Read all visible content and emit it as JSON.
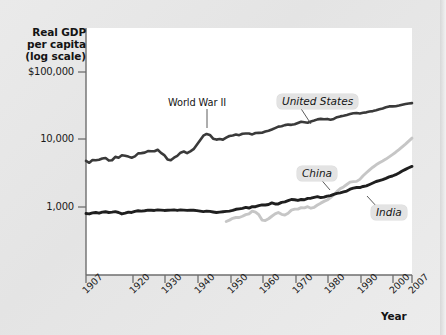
{
  "chart_data": {
    "type": "line",
    "title": "",
    "ylabel": "Real GDP per capita (log scale)",
    "xlabel": "Year",
    "ylabel_lines": [
      "Real GDP",
      "per capita",
      "(log scale)"
    ],
    "yscale": "log",
    "ytick_labels": [
      "$100,000",
      "10,000",
      "1,000"
    ],
    "ytick_values": [
      100000,
      10000,
      1000
    ],
    "ylim": [
      450,
      260000
    ],
    "xlim": [
      1907,
      2007
    ],
    "xtick_labels": [
      "1907",
      "1920",
      "1930",
      "1940",
      "1950",
      "1960",
      "1970",
      "1980",
      "1990",
      "2000",
      "2007"
    ],
    "xtick_values": [
      1907,
      1920,
      1930,
      1940,
      1950,
      1960,
      1970,
      1980,
      1990,
      2000,
      2007
    ],
    "grid": false,
    "legend_position": "inline-callouts",
    "annotations": [
      {
        "text": "World War II",
        "x": 1944,
        "y": 13000
      }
    ],
    "series": [
      {
        "name": "United States",
        "color": "#3a3a3a",
        "x": [
          1907,
          1908,
          1909,
          1910,
          1911,
          1912,
          1913,
          1914,
          1915,
          1916,
          1917,
          1918,
          1919,
          1920,
          1921,
          1922,
          1923,
          1924,
          1925,
          1926,
          1927,
          1928,
          1929,
          1930,
          1931,
          1932,
          1933,
          1934,
          1935,
          1936,
          1937,
          1938,
          1939,
          1940,
          1941,
          1942,
          1943,
          1944,
          1945,
          1946,
          1947,
          1948,
          1949,
          1950,
          1951,
          1952,
          1953,
          1954,
          1955,
          1956,
          1957,
          1958,
          1959,
          1960,
          1961,
          1962,
          1963,
          1964,
          1965,
          1966,
          1967,
          1968,
          1969,
          1970,
          1971,
          1972,
          1973,
          1974,
          1975,
          1976,
          1977,
          1978,
          1979,
          1980,
          1981,
          1982,
          1983,
          1984,
          1985,
          1986,
          1987,
          1988,
          1989,
          1990,
          1991,
          1992,
          1993,
          1994,
          1995,
          1996,
          1997,
          1998,
          1999,
          2000,
          2001,
          2002,
          2003,
          2004,
          2005,
          2006,
          2007
        ],
        "y": [
          4800,
          4500,
          4950,
          4900,
          4980,
          5200,
          5300,
          4850,
          4900,
          5500,
          5350,
          5800,
          5700,
          5550,
          5350,
          5600,
          6200,
          6250,
          6350,
          6700,
          6650,
          6650,
          7000,
          6300,
          5850,
          5050,
          4900,
          5350,
          5700,
          6350,
          6600,
          6250,
          6650,
          7150,
          8300,
          9700,
          11300,
          12000,
          11600,
          10200,
          9900,
          10100,
          9900,
          10600,
          11200,
          11400,
          11750,
          11500,
          12100,
          12150,
          12150,
          11800,
          12400,
          12450,
          12500,
          13000,
          13400,
          13950,
          14650,
          15400,
          15600,
          16200,
          16500,
          16350,
          16650,
          17400,
          18200,
          17900,
          17600,
          18350,
          18950,
          19700,
          20050,
          19750,
          20000,
          19400,
          20000,
          21200,
          21800,
          22300,
          22900,
          23600,
          24200,
          24400,
          24050,
          24600,
          25000,
          25700,
          26100,
          26800,
          27700,
          28600,
          29700,
          30600,
          30600,
          30800,
          31500,
          32400,
          33200,
          33800,
          34200
        ]
      },
      {
        "name": "China",
        "color": "#c6c6c6",
        "x": [
          1950,
          1951,
          1952,
          1953,
          1954,
          1955,
          1956,
          1957,
          1958,
          1959,
          1960,
          1961,
          1962,
          1963,
          1964,
          1965,
          1966,
          1967,
          1968,
          1969,
          1970,
          1971,
          1972,
          1973,
          1974,
          1975,
          1976,
          1977,
          1978,
          1979,
          1980,
          1981,
          1982,
          1983,
          1984,
          1985,
          1986,
          1987,
          1988,
          1989,
          1990,
          1991,
          1992,
          1993,
          1994,
          1995,
          1996,
          1997,
          1998,
          1999,
          2000,
          2001,
          2002,
          2003,
          2004,
          2005,
          2006,
          2007
        ],
        "y": [
          610,
          640,
          680,
          700,
          700,
          730,
          770,
          790,
          870,
          840,
          770,
          640,
          630,
          670,
          730,
          790,
          830,
          780,
          760,
          810,
          900,
          930,
          930,
          980,
          970,
          1010,
          960,
          990,
          1070,
          1140,
          1210,
          1270,
          1380,
          1510,
          1700,
          1870,
          1980,
          2150,
          2330,
          2370,
          2390,
          2560,
          2890,
          3200,
          3540,
          3870,
          4200,
          4500,
          4780,
          5100,
          5500,
          5940,
          6440,
          7040,
          7740,
          8490,
          9400,
          10400
        ]
      },
      {
        "name": "India",
        "color": "#1f1f1f",
        "x": [
          1907,
          1908,
          1909,
          1910,
          1911,
          1912,
          1913,
          1914,
          1915,
          1916,
          1917,
          1918,
          1919,
          1920,
          1921,
          1922,
          1923,
          1924,
          1925,
          1926,
          1927,
          1928,
          1929,
          1930,
          1931,
          1932,
          1933,
          1934,
          1935,
          1936,
          1937,
          1938,
          1939,
          1940,
          1941,
          1942,
          1943,
          1944,
          1945,
          1946,
          1947,
          1948,
          1949,
          1950,
          1951,
          1952,
          1953,
          1954,
          1955,
          1956,
          1957,
          1958,
          1959,
          1960,
          1961,
          1962,
          1963,
          1964,
          1965,
          1966,
          1967,
          1968,
          1969,
          1970,
          1971,
          1972,
          1973,
          1974,
          1975,
          1976,
          1977,
          1978,
          1979,
          1980,
          1981,
          1982,
          1983,
          1984,
          1985,
          1986,
          1987,
          1988,
          1989,
          1990,
          1991,
          1992,
          1993,
          1994,
          1995,
          1996,
          1997,
          1998,
          1999,
          2000,
          2001,
          2002,
          2003,
          2004,
          2005,
          2006,
          2007
        ],
        "y": [
          800,
          790,
          820,
          830,
          810,
          840,
          850,
          830,
          840,
          855,
          830,
          790,
          810,
          840,
          830,
          860,
          880,
          870,
          880,
          900,
          895,
          890,
          905,
          900,
          890,
          895,
          900,
          905,
          890,
          905,
          900,
          890,
          900,
          895,
          885,
          870,
          855,
          870,
          860,
          845,
          830,
          840,
          850,
          860,
          870,
          890,
          925,
          940,
          955,
          985,
          965,
          1010,
          1010,
          1050,
          1075,
          1070,
          1090,
          1150,
          1110,
          1110,
          1170,
          1190,
          1240,
          1290,
          1280,
          1250,
          1290,
          1280,
          1340,
          1350,
          1390,
          1420,
          1380,
          1400,
          1450,
          1470,
          1540,
          1590,
          1620,
          1670,
          1720,
          1830,
          1900,
          1940,
          1940,
          2010,
          2050,
          2150,
          2260,
          2380,
          2460,
          2540,
          2650,
          2780,
          2870,
          3000,
          3180,
          3400,
          3600,
          3800,
          3980
        ]
      }
    ]
  },
  "callouts": {
    "united_states": "United States",
    "china": "China",
    "india": "India"
  }
}
